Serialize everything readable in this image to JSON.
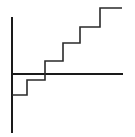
{
  "chart_data": {
    "type": "line",
    "subtype": "step",
    "title": "",
    "xlabel": "",
    "ylabel": "",
    "series": [
      {
        "name": "step-function",
        "x": [
          0,
          1,
          2,
          3,
          4,
          5,
          6
        ],
        "values": [
          -1,
          -0.3,
          0.6,
          1.5,
          2.3,
          3.1,
          3.1
        ]
      }
    ],
    "grid": false,
    "legend": null,
    "axes": {
      "x_axis_at_zero": true,
      "y_axis_at_left": true
    },
    "colors": {
      "line": "#2a2a2a",
      "axis": "#1a1a1a",
      "background": "#ffffff"
    }
  },
  "geometry": {
    "y_axis": {
      "x": 12,
      "y1": 17,
      "y2": 133
    },
    "x_axis": {
      "y": 74,
      "x1": 12,
      "x2": 123
    },
    "step_points": "12,95 27,95 27,80 45,80 45,61 63,61 63,43 80,43 80,27 100,27 100,8 122,8"
  }
}
